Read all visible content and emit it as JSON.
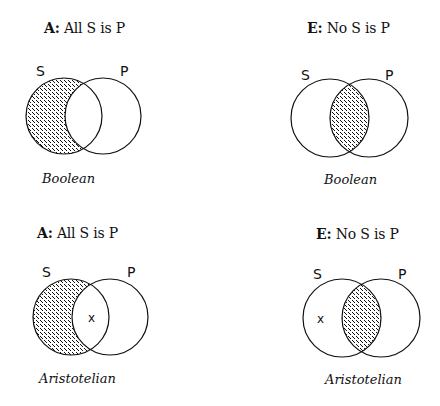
{
  "panels": [
    {
      "id": "boolean-a",
      "title_key": "A:",
      "title_text": "All S is P",
      "caption": "Boolean",
      "label_s": "S",
      "label_p": "P",
      "shaded_region": "S only",
      "x_mark": ""
    },
    {
      "id": "boolean-e",
      "title_key": "E:",
      "title_text": "No S is P",
      "caption": "Boolean",
      "label_s": "S",
      "label_p": "P",
      "shaded_region": "S and P overlap",
      "x_mark": ""
    },
    {
      "id": "aristotelian-a",
      "title_key": "A:",
      "title_text": "All S is P",
      "caption": "Aristotelian",
      "label_s": "S",
      "label_p": "P",
      "shaded_region": "S only",
      "x_mark": "x"
    },
    {
      "id": "aristotelian-e",
      "title_key": "E:",
      "title_text": "No S is P",
      "caption": "Aristotelian",
      "label_s": "S",
      "label_p": "P",
      "shaded_region": "S and P overlap",
      "x_mark": "x"
    }
  ],
  "colors": {
    "stroke": "#111111",
    "background": "#ffffff"
  }
}
